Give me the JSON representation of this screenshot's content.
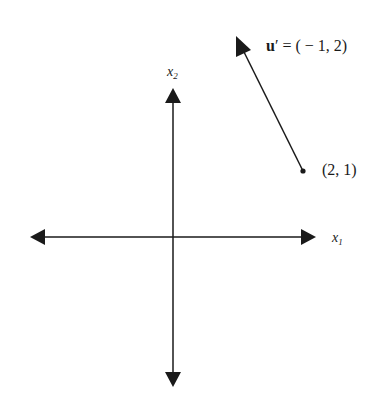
{
  "diagram": {
    "type": "vector-plot",
    "axes": {
      "x_label": "x",
      "x_sub": "1",
      "y_label": "x",
      "y_sub": "2"
    },
    "vector": {
      "name": "u",
      "prime": "′",
      "equals": " = ( − 1, 2)",
      "components": [
        -1,
        2
      ],
      "tail_point_label": "(2, 1)",
      "tail_point": [
        2,
        1
      ]
    },
    "colors": {
      "ink": "#1a1a1a",
      "background": "#ffffff"
    }
  }
}
